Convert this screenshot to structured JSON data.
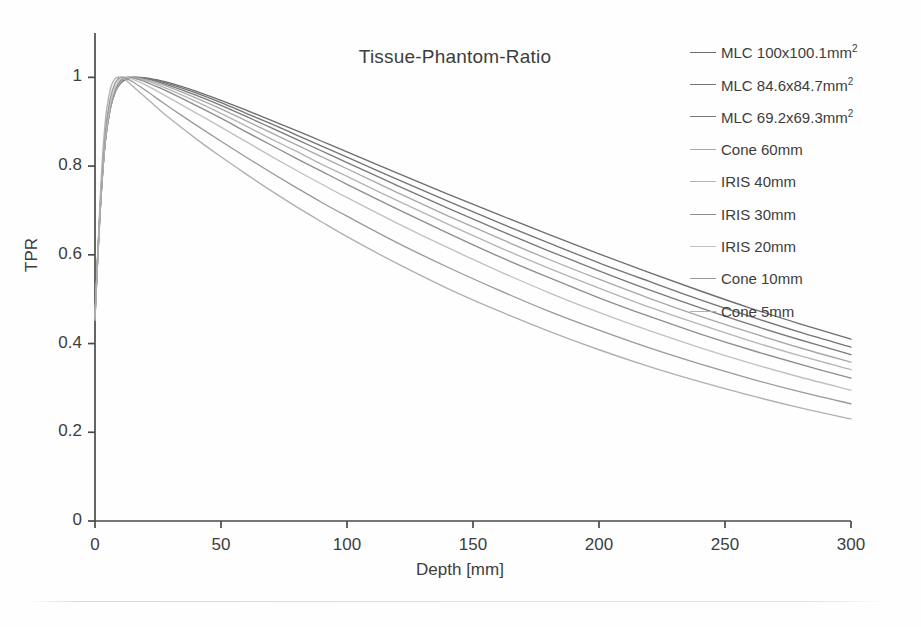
{
  "chart_data": {
    "type": "line",
    "title": "Tissue-Phantom-Ratio",
    "xlabel": "Depth [mm]",
    "ylabel": "TPR",
    "xlim": [
      0,
      300
    ],
    "ylim": [
      0,
      1.1
    ],
    "xticks": [
      0,
      50,
      100,
      150,
      200,
      250,
      300
    ],
    "xtick_labels": [
      "0",
      "50",
      "100",
      "150",
      "200",
      "250",
      "300"
    ],
    "yticks": [
      0,
      0.2,
      0.4,
      0.6,
      0.8,
      1
    ],
    "ytick_labels": [
      "0",
      "0.2",
      "0.4",
      "0.6",
      "0.8",
      "1"
    ],
    "grid": false,
    "legend_position": "right",
    "x": [
      0,
      2,
      4,
      6,
      8,
      10,
      12,
      15,
      20,
      25,
      30,
      40,
      50,
      60,
      70,
      80,
      90,
      100,
      120,
      140,
      160,
      180,
      200,
      220,
      240,
      260,
      280,
      300
    ],
    "series": [
      {
        "name": "MLC 100x100.1mm²",
        "color": "#6e6e6e",
        "values": [
          0.47,
          0.7,
          0.855,
          0.93,
          0.968,
          0.986,
          0.995,
          1.0,
          0.999,
          0.994,
          0.987,
          0.969,
          0.948,
          0.926,
          0.903,
          0.88,
          0.856,
          0.832,
          0.784,
          0.737,
          0.691,
          0.646,
          0.602,
          0.56,
          0.519,
          0.48,
          0.444,
          0.41
        ]
      },
      {
        "name": "MLC 84.6x84.7mm²",
        "color": "#747474",
        "values": [
          0.468,
          0.698,
          0.853,
          0.929,
          0.967,
          0.986,
          0.996,
          1.0,
          0.998,
          0.992,
          0.984,
          0.965,
          0.943,
          0.919,
          0.895,
          0.87,
          0.845,
          0.82,
          0.77,
          0.721,
          0.673,
          0.627,
          0.582,
          0.54,
          0.499,
          0.461,
          0.425,
          0.392
        ]
      },
      {
        "name": "MLC 69.2x69.3mm²",
        "color": "#7a7a7a",
        "values": [
          0.466,
          0.696,
          0.851,
          0.928,
          0.967,
          0.987,
          0.997,
          1.0,
          0.997,
          0.99,
          0.981,
          0.96,
          0.937,
          0.912,
          0.886,
          0.86,
          0.834,
          0.808,
          0.756,
          0.705,
          0.656,
          0.609,
          0.564,
          0.521,
          0.481,
          0.443,
          0.408,
          0.375
        ]
      },
      {
        "name": "Cone 60mm",
        "color": "#a8a8a8",
        "values": [
          0.464,
          0.694,
          0.85,
          0.927,
          0.967,
          0.988,
          0.998,
          1.0,
          0.995,
          0.987,
          0.977,
          0.954,
          0.929,
          0.902,
          0.875,
          0.848,
          0.821,
          0.794,
          0.74,
          0.688,
          0.638,
          0.59,
          0.545,
          0.502,
          0.462,
          0.425,
          0.39,
          0.358
        ]
      },
      {
        "name": "IRIS 40mm",
        "color": "#b4b4b4",
        "values": [
          0.462,
          0.693,
          0.85,
          0.928,
          0.969,
          0.99,
          0.999,
          1.0,
          0.993,
          0.983,
          0.971,
          0.946,
          0.919,
          0.89,
          0.861,
          0.833,
          0.804,
          0.777,
          0.722,
          0.669,
          0.618,
          0.57,
          0.525,
          0.482,
          0.443,
          0.406,
          0.372,
          0.341
        ]
      },
      {
        "name": "IRIS 30mm",
        "color": "#8e8e8e",
        "values": [
          0.46,
          0.692,
          0.851,
          0.93,
          0.971,
          0.992,
          1.0,
          0.999,
          0.99,
          0.978,
          0.965,
          0.937,
          0.908,
          0.877,
          0.847,
          0.817,
          0.788,
          0.759,
          0.703,
          0.649,
          0.597,
          0.549,
          0.503,
          0.461,
          0.422,
          0.386,
          0.353,
          0.322
        ]
      },
      {
        "name": "IRIS 20mm",
        "color": "#c0c0c0",
        "values": [
          0.458,
          0.695,
          0.857,
          0.937,
          0.977,
          0.996,
          1.0,
          0.996,
          0.983,
          0.968,
          0.952,
          0.92,
          0.888,
          0.855,
          0.822,
          0.79,
          0.759,
          0.729,
          0.671,
          0.616,
          0.564,
          0.515,
          0.47,
          0.429,
          0.391,
          0.356,
          0.324,
          0.295
        ]
      },
      {
        "name": "Cone 10mm",
        "color": "#9a9a9a",
        "values": [
          0.455,
          0.706,
          0.873,
          0.951,
          0.987,
          1.0,
          0.999,
          0.99,
          0.971,
          0.951,
          0.931,
          0.893,
          0.856,
          0.82,
          0.785,
          0.751,
          0.718,
          0.687,
          0.627,
          0.572,
          0.521,
          0.473,
          0.43,
          0.39,
          0.354,
          0.321,
          0.291,
          0.264
        ]
      },
      {
        "name": "Cone 5mm",
        "color": "#b0b0b0",
        "values": [
          0.452,
          0.722,
          0.896,
          0.971,
          0.997,
          1.0,
          0.995,
          0.98,
          0.955,
          0.93,
          0.906,
          0.862,
          0.821,
          0.782,
          0.744,
          0.708,
          0.674,
          0.641,
          0.58,
          0.524,
          0.474,
          0.428,
          0.386,
          0.348,
          0.314,
          0.283,
          0.255,
          0.23
        ]
      }
    ]
  },
  "axes": {
    "title": "Tissue-Phantom-Ratio",
    "xlabel": "Depth [mm]",
    "ylabel": "TPR"
  },
  "colors": {
    "axis": "#4a4a4a",
    "text": "#3d3d3d",
    "background": "#fefefe"
  }
}
